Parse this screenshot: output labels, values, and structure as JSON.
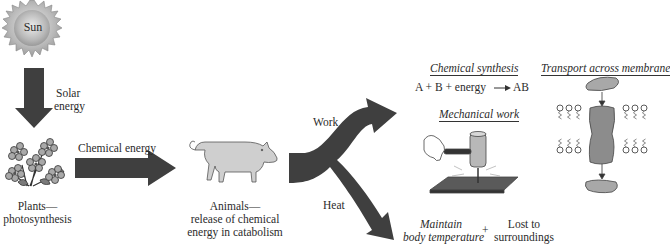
{
  "diagram": {
    "sun": {
      "label": "Sun"
    },
    "solar_energy": {
      "label_line1": "Solar",
      "label_line2": "energy"
    },
    "plants": {
      "label_line1": "Plants—",
      "label_line2": "photosynthesis"
    },
    "chemical_energy": {
      "label": "Chemical energy"
    },
    "animals": {
      "label_line1": "Animals—",
      "label_line2": "release of chemical",
      "label_line3": "energy in catabolism"
    },
    "work": {
      "label": "Work"
    },
    "heat": {
      "label": "Heat"
    },
    "chemical_synthesis": {
      "title": "Chemical synthesis",
      "equation_left": "A + B + energy",
      "equation_right": "AB"
    },
    "mechanical_work": {
      "title": "Mechanical work"
    },
    "transport": {
      "title": "Transport across membrane"
    },
    "heat_outcomes": {
      "maintain_line1": "Maintain",
      "maintain_line2": "body temperature",
      "plus": "+",
      "lost_line1": "Lost to",
      "lost_line2": "surroundings"
    },
    "colors": {
      "arrow_fill": "#3f3f3f",
      "sun_fill": "#b5b5b5",
      "pig_fill": "#cfcfcf",
      "protein_fill": "#8c8c8c",
      "flower_fill": "#a9a9a9"
    }
  }
}
